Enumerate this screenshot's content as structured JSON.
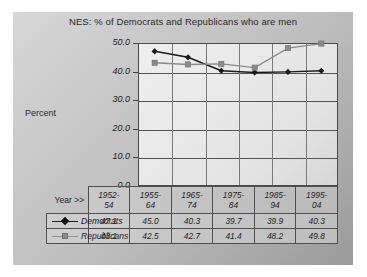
{
  "chart_data": {
    "type": "line",
    "title": "NES:  % of Democrats and Republicans who are men",
    "xlabel": "",
    "ylabel": "Percent",
    "ylim": [
      0.0,
      50.0
    ],
    "yticks": [
      "50.0",
      "40.0",
      "30.0",
      "20.0",
      "10.0",
      "0.0"
    ],
    "ytick_values": [
      50.0,
      40.0,
      30.0,
      20.0,
      10.0,
      0.0
    ],
    "grid": true,
    "legend_position": "data-table",
    "categories": [
      "1952-54",
      "1955-64",
      "1965-74",
      "1975-84",
      "1985-94",
      "1995-04"
    ],
    "categories_split": [
      {
        "top": "1952-",
        "bottom": "54"
      },
      {
        "top": "1955-",
        "bottom": "64"
      },
      {
        "top": "1965-",
        "bottom": "74"
      },
      {
        "top": "1975-",
        "bottom": "84"
      },
      {
        "top": "1985-",
        "bottom": "94"
      },
      {
        "top": "1995-",
        "bottom": "04"
      }
    ],
    "series": [
      {
        "name": "Democrats",
        "color": "#1b1b1b",
        "marker": "diamond",
        "values": [
          47.1,
          45.0,
          40.3,
          39.7,
          39.9,
          40.3
        ],
        "labels": [
          "47.1",
          "45.0",
          "40.3",
          "39.7",
          "39.9",
          "40.3"
        ]
      },
      {
        "name": "Republicans",
        "color": "#8a8a8a",
        "marker": "square",
        "values": [
          43.1,
          42.5,
          42.7,
          41.4,
          48.2,
          49.8
        ],
        "labels": [
          "43.1",
          "42.5",
          "42.7",
          "41.4",
          "48.2",
          "49.8"
        ]
      }
    ]
  },
  "table": {
    "year_label": "Year >>"
  },
  "colors": {
    "democrats": "#1b1b1b",
    "republicans": "#8a8a8a",
    "axis": "#4a4a4a",
    "panel_light": "#d7d7d7",
    "panel_dark": "#9a9a9a"
  }
}
